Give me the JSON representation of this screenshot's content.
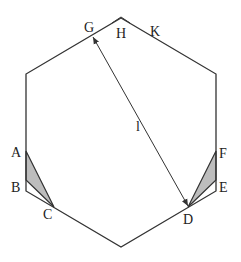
{
  "diagram": {
    "type": "geometry",
    "shape": "regular hexagon with two shaded corner triangles and a measured diagonal",
    "colors": {
      "stroke": "#333333",
      "shade": "#bdbdbd",
      "background": "#ffffff"
    },
    "hexagon": {
      "vertices": [
        [
          121,
          18
        ],
        [
          216,
          74
        ],
        [
          216,
          191
        ],
        [
          121,
          247
        ],
        [
          26,
          191
        ],
        [
          26,
          74
        ]
      ]
    },
    "shaded_triangles": [
      {
        "name": "ABC",
        "points": [
          [
            26,
            151
          ],
          [
            26,
            180
          ],
          [
            54,
            207
          ]
        ]
      },
      {
        "name": "FED",
        "points": [
          [
            216,
            151
          ],
          [
            216,
            180
          ],
          [
            188,
            207
          ]
        ]
      }
    ],
    "arrow": {
      "from": [
        93,
        37
      ],
      "to": [
        188,
        206
      ],
      "label": "l"
    },
    "labels": {
      "G": "G",
      "H": "H",
      "K": "K",
      "A": "A",
      "B": "B",
      "C": "C",
      "D": "D",
      "E": "E",
      "F": "F",
      "l": "l"
    }
  }
}
